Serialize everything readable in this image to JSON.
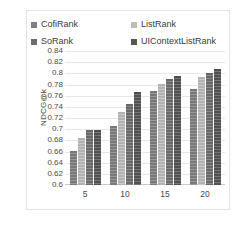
{
  "chart_data": {
    "type": "bar",
    "title": "",
    "xlabel": "",
    "ylabel": "NDCG@k",
    "categories": [
      "5",
      "10",
      "15",
      "20"
    ],
    "ylim": [
      0.6,
      0.84
    ],
    "ytick_labels": [
      "0.84",
      "0.82",
      "0.8",
      "0.78",
      "0.76",
      "0.74",
      "0.72",
      "0.7",
      "0.68",
      "0.66",
      "0.64",
      "0.62",
      "0.6"
    ],
    "ytick_values": [
      0.84,
      0.82,
      0.8,
      0.78,
      0.76,
      0.74,
      0.72,
      0.7,
      0.68,
      0.66,
      0.64,
      0.62,
      0.6
    ],
    "grid": true,
    "legend_position": "top",
    "series": [
      {
        "name": "CofiRank",
        "color": "#7f7f7f",
        "values": [
          0.661,
          0.706,
          0.768,
          0.772
        ]
      },
      {
        "name": "ListRank",
        "color": "#bdbdbd",
        "values": [
          0.684,
          0.731,
          0.781,
          0.793
        ]
      },
      {
        "name": "SoRank",
        "color": "#6e6e6e",
        "values": [
          0.699,
          0.745,
          0.79,
          0.801
        ]
      },
      {
        "name": "UIContextListRank",
        "color": "#555555",
        "values": [
          0.699,
          0.767,
          0.796,
          0.808
        ]
      }
    ]
  },
  "legend": {
    "items": [
      {
        "label": "CofiRank",
        "color": "#7f7f7f"
      },
      {
        "label": "ListRank",
        "color": "#bdbdbd"
      },
      {
        "label": "SoRank",
        "color": "#6e6e6e"
      },
      {
        "label": "UIContextListRank",
        "color": "#555555"
      }
    ]
  },
  "axis": {
    "y_title": "NDCG@k"
  }
}
